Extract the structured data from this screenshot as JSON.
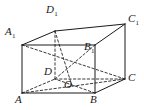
{
  "figure": {
    "kind": "cuboid-wireframe-diagram",
    "canvas": {
      "width": 144,
      "height": 110
    },
    "colors": {
      "background": "#ffffff",
      "solid_edge": "#1a1a1a",
      "hidden_edge": "#3a3a3a",
      "label_text": "#1a1a1a"
    },
    "stroke": {
      "solid_width": 1,
      "hidden_width": 1,
      "hidden_dash": "2.4,2.2"
    },
    "vertices": [
      {
        "id": "A",
        "base": "A",
        "sub": "",
        "x": 22,
        "y": 93,
        "label_x": 15,
        "label_y": 94,
        "hidden": false
      },
      {
        "id": "B",
        "base": "B",
        "sub": "",
        "x": 95,
        "y": 93,
        "label_x": 90,
        "label_y": 94,
        "hidden": false
      },
      {
        "id": "C",
        "base": "C",
        "sub": "",
        "x": 125,
        "y": 79,
        "label_x": 128,
        "label_y": 72,
        "hidden": false
      },
      {
        "id": "D",
        "base": "D",
        "sub": "",
        "x": 55,
        "y": 79,
        "label_x": 44,
        "label_y": 66,
        "hidden": true
      },
      {
        "id": "A1",
        "base": "A",
        "sub": "1",
        "x": 22,
        "y": 45,
        "label_x": 5,
        "label_y": 26,
        "hidden": false
      },
      {
        "id": "B1",
        "base": "B",
        "sub": "1",
        "x": 95,
        "y": 45,
        "label_x": 84,
        "label_y": 41,
        "hidden": false
      },
      {
        "id": "C1",
        "base": "C",
        "sub": "1",
        "x": 125,
        "y": 24,
        "label_x": 128,
        "label_y": 13,
        "hidden": false
      },
      {
        "id": "D1",
        "base": "D",
        "sub": "1",
        "x": 55,
        "y": 31,
        "label_x": 46,
        "label_y": 4,
        "hidden": true
      },
      {
        "id": "O",
        "base": "O",
        "sub": "",
        "x": 72,
        "y": 86,
        "label_x": 64,
        "label_y": 79,
        "hidden": true
      }
    ],
    "edges_solid": [
      {
        "name": "A-B",
        "x1": 22,
        "y1": 93,
        "x2": 95,
        "y2": 93
      },
      {
        "name": "B-C",
        "x1": 95,
        "y1": 93,
        "x2": 125,
        "y2": 79
      },
      {
        "name": "A-A1",
        "x1": 22,
        "y1": 93,
        "x2": 22,
        "y2": 45
      },
      {
        "name": "B-B1",
        "x1": 95,
        "y1": 93,
        "x2": 95,
        "y2": 45
      },
      {
        "name": "C-C1",
        "x1": 125,
        "y1": 79,
        "x2": 125,
        "y2": 24
      },
      {
        "name": "A1-B1",
        "x1": 22,
        "y1": 45,
        "x2": 95,
        "y2": 45
      },
      {
        "name": "B1-C1",
        "x1": 95,
        "y1": 45,
        "x2": 125,
        "y2": 24
      },
      {
        "name": "A1-D1",
        "x1": 22,
        "y1": 45,
        "x2": 55,
        "y2": 31
      },
      {
        "name": "D1-C1",
        "x1": 55,
        "y1": 31,
        "x2": 125,
        "y2": 24
      }
    ],
    "edges_hidden": [
      {
        "name": "A-D",
        "x1": 22,
        "y1": 93,
        "x2": 55,
        "y2": 79
      },
      {
        "name": "D-C",
        "x1": 55,
        "y1": 79,
        "x2": 125,
        "y2": 79
      },
      {
        "name": "D-D1",
        "x1": 55,
        "y1": 79,
        "x2": 55,
        "y2": 31
      }
    ],
    "diagonals_hidden": [
      {
        "name": "A-C-through-O",
        "x1": 22,
        "y1": 93,
        "x2": 125,
        "y2": 79
      },
      {
        "name": "B-D-through-O",
        "x1": 95,
        "y1": 93,
        "x2": 55,
        "y2": 79
      },
      {
        "name": "D1-O",
        "x1": 55,
        "y1": 31,
        "x2": 72,
        "y2": 86
      },
      {
        "name": "D-B1",
        "x1": 55,
        "y1": 79,
        "x2": 95,
        "y2": 45
      },
      {
        "name": "A1-C",
        "x1": 22,
        "y1": 45,
        "x2": 125,
        "y2": 79
      }
    ]
  }
}
